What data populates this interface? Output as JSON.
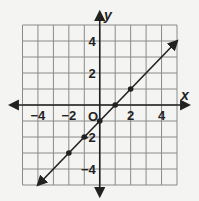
{
  "chart_data": {
    "type": "line",
    "title": "",
    "xlabel": "x",
    "ylabel": "y",
    "origin_label": "O",
    "xlim": [
      -5,
      5
    ],
    "ylim": [
      -5,
      5
    ],
    "grid": true,
    "x_ticks": [
      -4,
      -2,
      2,
      4
    ],
    "y_ticks": [
      4,
      2,
      -2,
      -4
    ],
    "tick_labels": {
      "x": [
        "−4",
        "−2",
        "2",
        "4"
      ],
      "y": [
        "4",
        "2",
        "−2",
        "−4"
      ]
    },
    "series": [
      {
        "name": "line",
        "equation": "y = x - 1",
        "line_extent": [
          [
            -4,
            -5
          ],
          [
            5,
            4
          ]
        ],
        "arrows_both_ends": true,
        "points": [
          [
            -2,
            -3
          ],
          [
            -1,
            -2
          ],
          [
            0,
            -1
          ],
          [
            1,
            0
          ],
          [
            2,
            1
          ]
        ]
      }
    ],
    "colors": {
      "grid": "#8a8a8a",
      "axis": "#222222",
      "line": "#222222",
      "background": "#f4f4f2"
    }
  }
}
